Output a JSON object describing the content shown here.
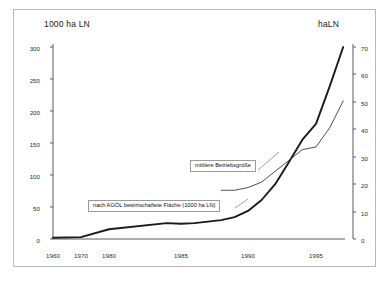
{
  "figure": {
    "background_color": "#ffffff",
    "frame_color": "#b9b9b9"
  },
  "axes": {
    "left_title": "1000 ha LN",
    "right_title": "haLN",
    "left_ticks": [
      "0",
      "50",
      "100",
      "150",
      "200",
      "250",
      "300"
    ],
    "right_ticks": [
      "0",
      "10",
      "20",
      "30",
      "40",
      "50",
      "60",
      "70"
    ],
    "x_ticks": [
      "1960",
      "1970",
      "1980",
      "1985",
      "1990",
      "1995"
    ]
  },
  "annotations": {
    "betriebsgroesse": "mittlere Betriebsgröße",
    "flaeche": "nach AGÖL bewirtschaftete Fläche (1000 ha LN)"
  },
  "chart_data": {
    "type": "line",
    "title": "",
    "xlabel": "",
    "ylabel": "1000 ha LN",
    "y2label": "haLN",
    "grid": false,
    "legend": "annotated-callouts",
    "x_tick_labels": [
      "1960",
      "1970",
      "1980",
      "1985",
      "1990",
      "1995"
    ],
    "x_tick_values": [
      1960,
      1970,
      1980,
      1985,
      1990,
      1995
    ],
    "x_axis_type": "piecewise-categorical",
    "ylim": [
      0,
      320
    ],
    "y2lim": [
      0,
      72
    ],
    "series": [
      {
        "name": "nach AGÖL bewirtschaftete Fläche (1000 ha LN)",
        "axis": "left",
        "units": "1000 ha LN",
        "line_width": "thick",
        "color": "#1a1a1a",
        "x": [
          1960,
          1970,
          1980,
          1984,
          1985,
          1986,
          1988,
          1989,
          1990,
          1991,
          1992,
          1993,
          1994,
          1995,
          1996,
          1997
        ],
        "values": [
          2,
          3,
          16,
          26,
          25,
          26,
          31,
          36,
          46,
          64,
          90,
          126,
          163,
          189,
          250,
          315
        ]
      },
      {
        "name": "mittlere Betriebsgröße",
        "axis": "right",
        "units": "ha LN",
        "line_width": "thin",
        "color": "#3a3a3a",
        "x": [
          1988,
          1989,
          1990,
          1991,
          1992,
          1993,
          1994,
          1995,
          1996,
          1997
        ],
        "values": [
          18,
          18,
          19,
          21,
          25,
          29,
          33,
          34,
          41,
          51
        ]
      }
    ]
  }
}
